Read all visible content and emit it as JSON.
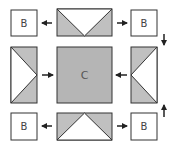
{
  "diagram": {
    "title": "",
    "colors": {
      "stroke": "#333333",
      "fill_gray": "#c0c0c0",
      "fill_white": "#ffffff",
      "center_fill": "#b5b5b5"
    },
    "boxes": {
      "top_left": {
        "label": "B"
      },
      "top_right": {
        "label": "B"
      },
      "bottom_left": {
        "label": "B"
      },
      "bottom_right": {
        "label": "B"
      },
      "center": {
        "label": "C"
      }
    },
    "pieces": {
      "top": "flying-geese-down",
      "bottom": "flying-geese-up",
      "left": "flying-geese-right",
      "right": "flying-geese-left"
    },
    "arrows": [
      {
        "id": "top-left",
        "direction": "left"
      },
      {
        "id": "top-right",
        "direction": "right"
      },
      {
        "id": "right-down",
        "direction": "down"
      },
      {
        "id": "left-in",
        "direction": "right"
      },
      {
        "id": "right-in",
        "direction": "left"
      },
      {
        "id": "right-up",
        "direction": "up"
      },
      {
        "id": "bottom-left",
        "direction": "left"
      },
      {
        "id": "bottom-right",
        "direction": "right"
      }
    ]
  }
}
